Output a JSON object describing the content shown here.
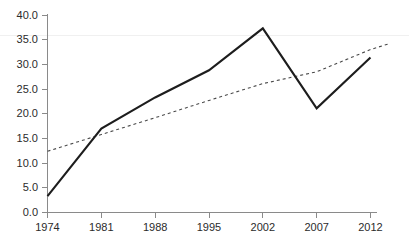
{
  "chart_data": {
    "type": "line",
    "title": "",
    "subtitle": "",
    "xlabel": "",
    "ylabel": "",
    "categories": [
      "1974",
      "1981",
      "1988",
      "1995",
      "2002",
      "2007",
      "2012"
    ],
    "series": [
      {
        "name": "data-series",
        "style": "solid",
        "color": "#1d1d1d",
        "values": [
          3.3,
          17.0,
          23.3,
          28.8,
          37.3,
          21.1,
          31.4
        ]
      },
      {
        "name": "trend-line",
        "style": "dashed",
        "color": "#4a4a4a",
        "values": [
          12.4,
          15.8,
          19.2,
          22.7,
          26.1,
          28.5,
          33.0
        ]
      }
    ],
    "ylim": [
      0.0,
      40.0
    ],
    "ytick_step": 5.0,
    "ytick_labels": [
      "0.0",
      "5.0",
      "10.0",
      "15.0",
      "20.0",
      "25.0",
      "30.0",
      "35.0",
      "40.0"
    ],
    "xtick_labels": [
      "1974",
      "1981",
      "1988",
      "1995",
      "2002",
      "2007",
      "2012"
    ],
    "grid": false,
    "legend": null,
    "legend_position": "none",
    "annotations": []
  },
  "axes": {
    "y_axis_name": "y-axis",
    "x_axis_name": "x-axis"
  },
  "colors": {
    "axis": "#8a8a8a",
    "series_solid": "#1d1d1d",
    "series_dashed": "#4a4a4a",
    "background": "#ffffff",
    "faint_rule": "#f0f0f0"
  }
}
